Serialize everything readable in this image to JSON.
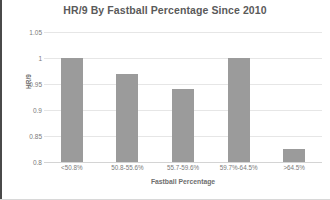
{
  "chart_data": {
    "type": "bar",
    "title": "HR/9 By Fastball Percentage Since 2010",
    "xlabel": "Fastball Percentage",
    "ylabel": "HR/9",
    "categories": [
      "<50.8%",
      "50.8-55.6%",
      "55.7-59.6%",
      "59.7%-64.5%",
      ">64.5%"
    ],
    "values": [
      1.0,
      0.97,
      0.94,
      1.0,
      0.825
    ],
    "ylim": [
      0.8,
      1.05
    ],
    "yticks": [
      "1.05",
      "1",
      "0.95",
      "0.9",
      "0.85",
      "0.8"
    ],
    "ytick_values": [
      1.05,
      1,
      0.95,
      0.9,
      0.85,
      0.8
    ],
    "grid": true,
    "legend": false,
    "bar_color": "#9b9b9b",
    "gridline_color": "#e6e6e6",
    "background_color": "#ffffff"
  }
}
